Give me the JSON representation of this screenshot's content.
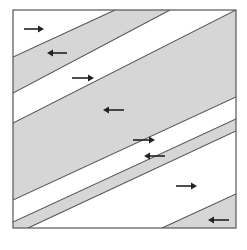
{
  "diagram": {
    "frame": {
      "x": 13,
      "y": 10,
      "width": 223,
      "height": 218
    },
    "colors": {
      "background": "#ffffff",
      "band": "#d6d6d6",
      "line": "#555555",
      "arrow": "#222222"
    },
    "bands": [
      {
        "fill": "band",
        "points": "13,57 115,10 170,10 13,93"
      },
      {
        "fill": "band",
        "points": "13,123 236,10 236,97 13,200"
      },
      {
        "fill": "band",
        "points": "13,222 236,119 236,131 28,228 13,228"
      },
      {
        "fill": "band",
        "points": "162,228 236,194 236,228"
      }
    ],
    "lines": [
      {
        "x1": 13,
        "y1": 57,
        "x2": 115,
        "y2": 10
      },
      {
        "x1": 13,
        "y1": 93,
        "x2": 170,
        "y2": 10
      },
      {
        "x1": 13,
        "y1": 123,
        "x2": 236,
        "y2": 10
      },
      {
        "x1": 13,
        "y1": 200,
        "x2": 236,
        "y2": 97
      },
      {
        "x1": 13,
        "y1": 222,
        "x2": 236,
        "y2": 119
      },
      {
        "x1": 28,
        "y1": 228,
        "x2": 236,
        "y2": 131
      },
      {
        "x1": 162,
        "y1": 228,
        "x2": 236,
        "y2": 194
      }
    ],
    "arrows": [
      {
        "direction": "right",
        "x1": 24,
        "x2": 44,
        "y": 29
      },
      {
        "direction": "left",
        "x1": 47,
        "x2": 67,
        "y": 53
      },
      {
        "direction": "right",
        "x1": 72,
        "x2": 94,
        "y": 78
      },
      {
        "direction": "left",
        "x1": 103,
        "x2": 124,
        "y": 110
      },
      {
        "direction": "right",
        "x1": 133,
        "x2": 155,
        "y": 140
      },
      {
        "direction": "left",
        "x1": 144,
        "x2": 165,
        "y": 156
      },
      {
        "direction": "right",
        "x1": 176,
        "x2": 197,
        "y": 186
      },
      {
        "direction": "left",
        "x1": 208,
        "x2": 229,
        "y": 220
      }
    ]
  }
}
